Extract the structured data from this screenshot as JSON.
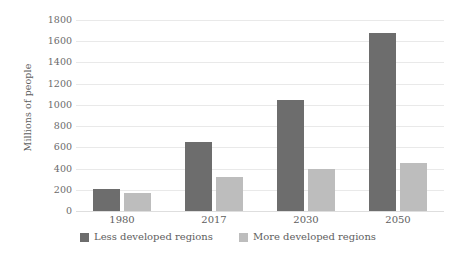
{
  "chart_data": {
    "type": "bar",
    "title": "",
    "subtitle": "",
    "xlabel": "",
    "ylabel": "Millions of people",
    "categories": [
      "1980",
      "2017",
      "2030",
      "2050"
    ],
    "series": [
      {
        "name": "Less developed regions",
        "color": "#6d6d6d",
        "values": [
          210,
          655,
          1045,
          1680
        ]
      },
      {
        "name": "More developed regions",
        "color": "#bdbdbd",
        "values": [
          170,
          320,
          395,
          455
        ]
      }
    ],
    "ylim": [
      0,
      1800
    ],
    "ytick_step": 200,
    "yticks": [
      0,
      200,
      400,
      600,
      800,
      1000,
      1200,
      1400,
      1600,
      1800
    ],
    "ytick_labels": [
      "0",
      "200",
      "400",
      "600",
      "800",
      "1000",
      "1200",
      "1400",
      "1600",
      "1800"
    ],
    "grid": true,
    "grid_axis": "y",
    "legend_position": "bottom",
    "background": "#ffffff",
    "grid_color": "#e9e9e9"
  }
}
